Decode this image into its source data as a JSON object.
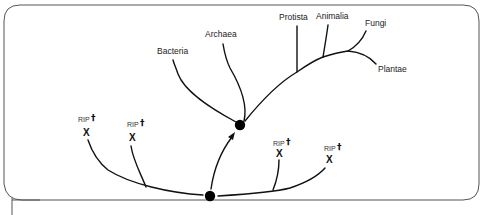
{
  "diagram": {
    "type": "phylogenetic-tree",
    "colors": {
      "line": "#111111",
      "frame": "#555555",
      "background": "#ffffff"
    },
    "living_groups": [
      {
        "label": "Bacteria"
      },
      {
        "label": "Archaea"
      },
      {
        "label": "Protista"
      },
      {
        "label": "Animalia"
      },
      {
        "label": "Fungi"
      },
      {
        "label": "Plantae"
      }
    ],
    "extinct_lineages": [
      {
        "label": "RIP",
        "dagger": "†",
        "marker": "X"
      },
      {
        "label": "RIP",
        "dagger": "†",
        "marker": "X"
      },
      {
        "label": "RIP",
        "dagger": "†",
        "marker": "X"
      },
      {
        "label": "RIP",
        "dagger": "†",
        "marker": "X"
      }
    ],
    "nodes": [
      {
        "name": "earliest-common-ancestor"
      },
      {
        "name": "last-universal-common-ancestor"
      }
    ]
  }
}
